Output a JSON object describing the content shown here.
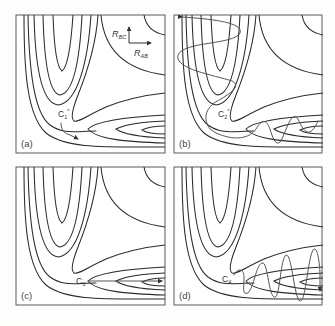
{
  "figure": {
    "axes_key": {
      "vertical": {
        "symbol": "R",
        "subscript": "BC"
      },
      "horizontal": {
        "symbol": "R",
        "subscript": "AB"
      }
    },
    "panels": [
      {
        "id": "a",
        "label": "(a)",
        "point": {
          "symbol": "C",
          "subscript": "1",
          "superscript": "*"
        },
        "trajectory": "arrow along reaction path into product valley (short arrow at corner)"
      },
      {
        "id": "b",
        "label": "(b)",
        "point": {
          "symbol": "C",
          "subscript": "2",
          "superscript": "*"
        },
        "trajectory": "oscillating in reactant valley, passing corner, oscillating in product valley"
      },
      {
        "id": "c",
        "label": "(c)",
        "point": {
          "symbol": "C",
          "subscript": "3",
          "superscript": ""
        },
        "trajectory": "straight arrow from saddle along product valley"
      },
      {
        "id": "d",
        "label": "(d)",
        "point": {
          "symbol": "C",
          "subscript": "4",
          "superscript": ""
        },
        "trajectory": "increasing-amplitude oscillation along product valley"
      }
    ]
  },
  "colors": {
    "contour": "#2a2a2a",
    "trajectory": "#555555",
    "frame": "#5a5a5a",
    "background": "#fdfdfc"
  }
}
